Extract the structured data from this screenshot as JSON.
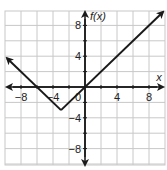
{
  "chart_data": {
    "type": "line",
    "title": "",
    "function": "f(x) = |x + 3| - 3",
    "xlabel": "x",
    "ylabel": "f(x)",
    "xlim": [
      -10,
      10
    ],
    "ylim": [
      -10,
      10
    ],
    "grid": true,
    "grid_step": 2,
    "x_ticks": [
      -8,
      -4,
      0,
      4,
      8
    ],
    "y_ticks": [
      8,
      4,
      -4,
      -8
    ],
    "x_tick_labels": [
      "−8",
      "−4",
      "0",
      "4",
      "8"
    ],
    "y_tick_labels": [
      "8",
      "4",
      "−4",
      "−8"
    ],
    "series": [
      {
        "name": "f(x)",
        "x": [
          -10,
          -3,
          10
        ],
        "y": [
          4,
          -3,
          10
        ],
        "arrows": "both"
      }
    ],
    "key_points": {
      "vertex": [
        -3,
        -3
      ],
      "x_intercepts": [
        -6,
        0
      ],
      "y_intercept": 0
    },
    "colors": {
      "line": "#1a1a1a",
      "grid": "#c8c8c8",
      "axis": "#1a1a1a"
    }
  }
}
